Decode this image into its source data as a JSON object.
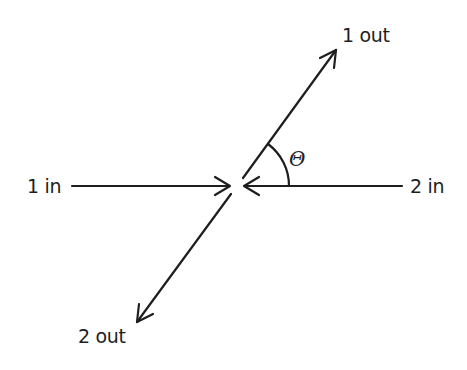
{
  "diagram": {
    "type": "scattering-geometry",
    "labels": {
      "in1": "1 in",
      "in2": "2 in",
      "out1": "1 out",
      "out2": "2 out",
      "angle": "Θ"
    },
    "colors": {
      "stroke": "#1e1e1e",
      "background": "#ffffff"
    },
    "geometry": {
      "center": [
        237,
        186
      ],
      "in1_line": {
        "from": [
          72,
          186
        ],
        "to": [
          228,
          186
        ]
      },
      "in2_line": {
        "from": [
          402,
          186
        ],
        "to": [
          246,
          186
        ]
      },
      "out1_line": {
        "from": [
          243,
          178
        ],
        "to": [
          336,
          50
        ]
      },
      "out2_line": {
        "from": [
          231,
          194
        ],
        "to": [
          137,
          322
        ]
      },
      "angle_arc_radius": 52
    }
  }
}
